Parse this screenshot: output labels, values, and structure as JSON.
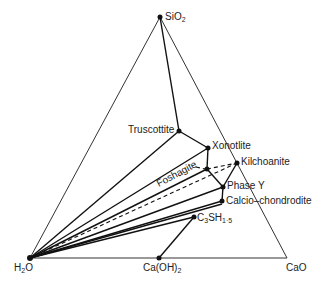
{
  "diagram": {
    "type": "ternary-phase-diagram",
    "vertices": {
      "top": {
        "label": "SiO",
        "sub": "2",
        "x": 160,
        "y": 17
      },
      "left": {
        "label": "H",
        "sub": "2",
        "after": "O",
        "x": 30,
        "y": 258
      },
      "right": {
        "label": "CaO",
        "x": 287,
        "y": 258
      }
    },
    "phases": [
      {
        "id": "truscottite",
        "label": "Truscottite",
        "x": 179,
        "y": 131
      },
      {
        "id": "xonotlite",
        "label": "Xonotlite",
        "x": 208,
        "y": 148
      },
      {
        "id": "foshagite",
        "label": "Foshagite",
        "x": 207,
        "y": 169
      },
      {
        "id": "kilchoanite",
        "label": "Kilchoanite",
        "x": 237,
        "y": 163
      },
      {
        "id": "phase-y",
        "label": "Phase Y",
        "x": 223,
        "y": 187
      },
      {
        "id": "calcio-chondrodite",
        "label": "Calcio–chondrodite",
        "x": 222,
        "y": 201
      },
      {
        "id": "c3sh",
        "label": "C",
        "sub1": "3",
        "mid": "SH",
        "sub2": "1·5",
        "x": 194,
        "y": 217
      },
      {
        "id": "caoh2",
        "label": "Ca(OH)",
        "sub": "2",
        "x": 159,
        "y": 258
      }
    ],
    "labels": {
      "sio2": "SiO",
      "sio2_sub": "2",
      "h2o_h": "H",
      "h2o_sub": "2",
      "h2o_o": "O",
      "cao": "CaO",
      "truscottite": "Truscottite",
      "xonotlite": "Xonotlite",
      "foshagite": "Foshagite",
      "kilchoanite": "Kilchoanite",
      "phase_y": "Phase Y",
      "calcio": "Calcio–chondrodite",
      "c3sh_c": "C",
      "c3sh_3": "3",
      "c3sh_sh": "SH",
      "c3sh_15": "1·5",
      "caoh": "Ca(OH)",
      "caoh_sub": "2"
    }
  }
}
